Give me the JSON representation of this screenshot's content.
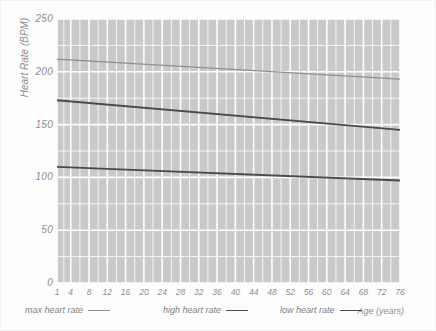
{
  "chart_data": {
    "type": "line",
    "title": "",
    "xlabel": "Age (years)",
    "ylabel": "Heart Rate (BPM)",
    "xlim": [
      1,
      76
    ],
    "ylim": [
      0,
      250
    ],
    "grid": true,
    "legend_position": "bottom",
    "x_ticks": [
      1,
      4,
      8,
      12,
      16,
      20,
      24,
      28,
      32,
      36,
      40,
      44,
      48,
      52,
      56,
      60,
      64,
      68,
      72,
      76
    ],
    "y_ticks": [
      0,
      50,
      100,
      150,
      200,
      250
    ],
    "x": [
      1,
      76
    ],
    "series": [
      {
        "name": "max heart rate",
        "color": "#8f8f8f",
        "width": 1.3,
        "values": [
          212,
          193
        ]
      },
      {
        "name": "high heart rate",
        "color": "#4a4a4a",
        "width": 1.9,
        "values": [
          173,
          145
        ]
      },
      {
        "name": "low heart rate",
        "color": "#4a4a4a",
        "width": 1.9,
        "values": [
          110,
          97
        ]
      }
    ]
  },
  "axes": {
    "y_label": "Heart Rate (BPM)",
    "x_label": "Age (years)",
    "y_tick_labels": [
      "250",
      "200",
      "150",
      "100",
      "50",
      "0"
    ],
    "x_tick_labels": [
      "1",
      "4",
      "8",
      "12",
      "16",
      "20",
      "24",
      "28",
      "32",
      "36",
      "40",
      "44",
      "48",
      "52",
      "56",
      "60",
      "64",
      "68",
      "72",
      "76"
    ]
  },
  "legend": {
    "items": [
      {
        "label": "max heart rate",
        "color": "#8f8f8f",
        "width": "1.3px"
      },
      {
        "label": "high heart rate",
        "color": "#4a4a4a",
        "width": "1.9px"
      },
      {
        "label": "low heart rate",
        "color": "#4a4a4a",
        "width": "1.9px"
      }
    ]
  },
  "style": {
    "plot_background": "#c9c9c9",
    "gridline_color": "#ffffff",
    "page_background": "#fdfdfd",
    "text_color": "#8e8e8e"
  }
}
